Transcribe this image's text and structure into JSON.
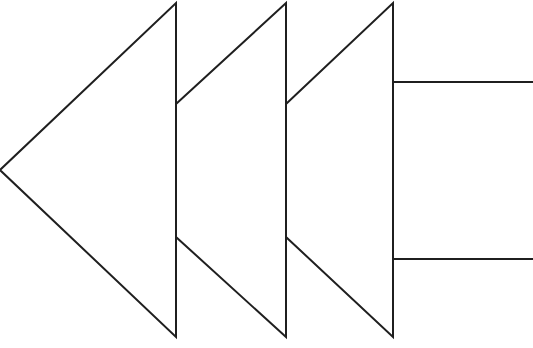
{
  "diagram": {
    "stroke_color": "#1f1f1f",
    "fill_color": "#ffffff",
    "shapes": {
      "head_1": "0,170 176,3 176,337",
      "head_2": "176,104 286,3 286,337 176,237",
      "head_3": "286,104 393,3 393,337 286,237",
      "tail": "393,82 534,82 534,259 393,259"
    }
  }
}
